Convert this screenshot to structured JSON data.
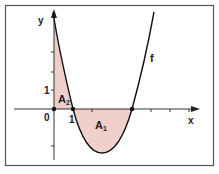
{
  "figure": {
    "axes": {
      "x_label": "x",
      "y_label": "y",
      "origin_label": "0",
      "x_tick_label": "1",
      "y_tick_label": "1"
    },
    "curve_label": "f",
    "areas": [
      {
        "label": "A",
        "sub": "1"
      },
      {
        "label": "A",
        "sub": "2"
      }
    ],
    "colors": {
      "fill": "#eecfc9",
      "stroke": "#111111",
      "frame": "#555555"
    }
  }
}
